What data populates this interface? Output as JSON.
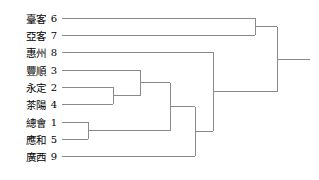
{
  "chart_data": {
    "type": "dendrogram",
    "title": "",
    "orientation": "horizontal-left-to-right",
    "leaves": [
      {
        "index": 1,
        "label": "總會",
        "row": 6
      },
      {
        "index": 2,
        "label": "永定",
        "row": 4
      },
      {
        "index": 3,
        "label": "豐順",
        "row": 3
      },
      {
        "index": 4,
        "label": "茶陽",
        "row": 5
      },
      {
        "index": 5,
        "label": "應和",
        "row": 7
      },
      {
        "index": 6,
        "label": "臺客",
        "row": 0
      },
      {
        "index": 7,
        "label": "亞客",
        "row": 1
      },
      {
        "index": 8,
        "label": "惠州",
        "row": 2
      },
      {
        "index": 9,
        "label": "廣西",
        "row": 8
      }
    ],
    "leaf_order_top_to_bottom": [
      6,
      7,
      8,
      3,
      2,
      4,
      1,
      5,
      9
    ],
    "merges": [
      {
        "id": "m1",
        "members": [
          2,
          4
        ],
        "x": 113
      },
      {
        "id": "m2",
        "members": [
          1,
          5
        ],
        "x": 88
      },
      {
        "id": "m3",
        "members": [
          3,
          "m1"
        ],
        "x": 140
      },
      {
        "id": "m4",
        "members": [
          "m3",
          "m2"
        ],
        "x": 170
      },
      {
        "id": "m5",
        "members": [
          "m4",
          9
        ],
        "x": 195
      },
      {
        "id": "m6",
        "members": [
          8,
          "m5"
        ],
        "x": 213
      },
      {
        "id": "m7",
        "members": [
          6,
          7
        ],
        "x": 255
      },
      {
        "id": "m8",
        "members": [
          "m7",
          "m6"
        ],
        "x": 277
      }
    ],
    "root_stem_end_x": 310,
    "leaf_line_start_x": 62,
    "row_y": [
      18,
      35,
      52,
      70,
      87,
      104,
      122,
      139,
      156
    ],
    "xlabel": "",
    "ylabel": "",
    "grid": false,
    "legend": null
  },
  "style": {
    "line_color": "#8a8a8a",
    "text_color": "#000000",
    "background": "#ffffff",
    "line_width": 1
  }
}
